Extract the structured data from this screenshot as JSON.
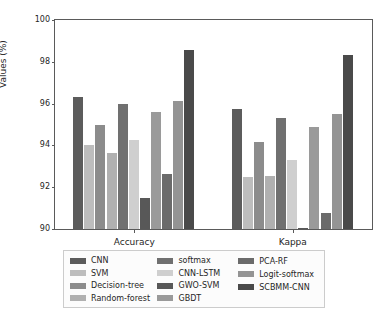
{
  "chart_data": {
    "type": "bar",
    "title": "",
    "xlabel": "",
    "ylabel": "Values (%)",
    "categories": [
      "Accuracy",
      "Kappa"
    ],
    "ylim": [
      90,
      100
    ],
    "yticks": [
      90,
      92,
      94,
      96,
      98,
      100
    ],
    "ytick_labels": [
      "90",
      "92",
      "94",
      "96",
      "98",
      "100"
    ],
    "grid": false,
    "legend_position": "below-axes",
    "legend_columns": 3,
    "series": [
      {
        "name": "CNN",
        "color": "#5c5c5c",
        "values": [
          96.32,
          95.73
        ]
      },
      {
        "name": "SVM",
        "color": "#bdbdbd",
        "values": [
          94.0,
          92.48
        ]
      },
      {
        "name": "Decision-tree",
        "color": "#8c8c8c",
        "values": [
          95.0,
          94.17
        ]
      },
      {
        "name": "Random-forest",
        "color": "#b0b0b0",
        "values": [
          93.63,
          92.56
        ]
      },
      {
        "name": "softmax",
        "color": "#707070",
        "values": [
          95.97,
          95.29
        ]
      },
      {
        "name": "CNN-LSTM",
        "color": "#cfcfcf",
        "values": [
          94.24,
          93.3
        ]
      },
      {
        "name": "GWO-SVM",
        "color": "#585858",
        "values": [
          91.5,
          90.06
        ]
      },
      {
        "name": "GBDT",
        "color": "#9a9a9a",
        "values": [
          95.62,
          94.89
        ]
      },
      {
        "name": "PCA-RF",
        "color": "#6b6b6b",
        "values": [
          92.65,
          90.76
        ]
      },
      {
        "name": "Logit-softmax",
        "color": "#949494",
        "values": [
          96.14,
          95.48
        ]
      },
      {
        "name": "SCBMM-CNN",
        "color": "#4a4a4a",
        "values": [
          98.57,
          98.34
        ]
      }
    ]
  },
  "legend": {
    "columns": [
      [
        "CNN",
        "SVM",
        "Decision-tree",
        "Random-forest"
      ],
      [
        "softmax",
        "CNN-LSTM",
        "GWO-SVM",
        "GBDT"
      ],
      [
        "PCA-RF",
        "Logit-softmax",
        "SCBMM-CNN"
      ]
    ]
  }
}
